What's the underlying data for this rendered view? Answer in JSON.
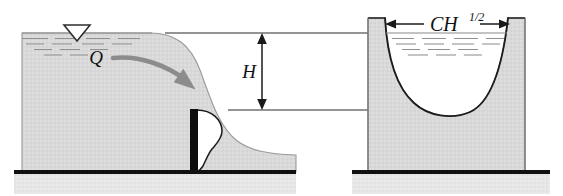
{
  "figure": {
    "background_color": "#ffffff"
  },
  "labels": {
    "discharge": "Q",
    "head": "H",
    "notch_width_base": "CH",
    "notch_width_exponent": "1/2",
    "notch_width_full": "CH1/2"
  },
  "colors": {
    "water_fill": "#d9d9d9",
    "water_fill_dark": "#d2d2d2",
    "ground_fill": "#e4e4e4",
    "outline": "#3a3a3a",
    "ground_line": "#101010",
    "weir_plate": "#0d0d0d",
    "nappe_white": "#ffffff",
    "flow_arrow": "#8c8c8c",
    "dimension_line": "#1a1a1a",
    "surface_hatch": "#8f8f8f",
    "reference_line": "#2b2b2b"
  },
  "side_view": {
    "name": "side-elevation",
    "water_surface_y": 33,
    "crest_level_y": 110,
    "ground_line_y": 172,
    "weir_plate_x": 192,
    "free_surface_symbol": "open-down-triangle",
    "flow_direction": "left-to-right",
    "nappe_profile": "ogee-s-curve"
  },
  "front_view": {
    "name": "front-elevation",
    "left_pier_x": 368,
    "right_pier_x": 525,
    "notch_shape": "parabolic-u-notch",
    "notch_top_y": 33,
    "notch_bottom_y": 110,
    "water_surface_y": 33,
    "ground_line_y": 172
  },
  "dimensions": {
    "head": {
      "label": "H",
      "orientation": "vertical",
      "from_y": 33,
      "to_y": 110,
      "x": 262,
      "arrowheads": "both"
    },
    "notch_width": {
      "label": "CH1/2",
      "orientation": "horizontal",
      "from_x": 385,
      "to_x": 510,
      "y": 24,
      "arrowheads": "both"
    }
  }
}
